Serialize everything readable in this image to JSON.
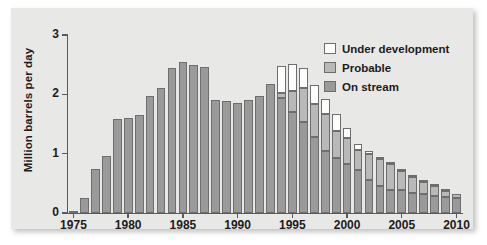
{
  "chart_data": {
    "type": "bar",
    "stacked": true,
    "title": "",
    "subtitle": "",
    "xlabel": "",
    "ylabel": "Million barrels per day",
    "ylim": [
      0,
      3
    ],
    "yticks": [
      0,
      1,
      2,
      3
    ],
    "ytick_labels": [
      "0",
      "1",
      "2",
      "3"
    ],
    "xlim": [
      1975,
      2010
    ],
    "xticks": [
      1975,
      1980,
      1985,
      1990,
      1995,
      2000,
      2005,
      2010
    ],
    "xtick_labels": [
      "1975",
      "1980",
      "1985",
      "1990",
      "1995",
      "2000",
      "2005",
      "2010"
    ],
    "grid": false,
    "legend_position": "top-right",
    "categories": [
      1975,
      1976,
      1977,
      1978,
      1979,
      1980,
      1981,
      1982,
      1983,
      1984,
      1985,
      1986,
      1987,
      1988,
      1989,
      1990,
      1991,
      1992,
      1993,
      1994,
      1995,
      1996,
      1997,
      1998,
      1999,
      2000,
      2001,
      2002,
      2003,
      2004,
      2005,
      2006,
      2007,
      2008,
      2009,
      2010
    ],
    "series": [
      {
        "name": "On stream",
        "color": "#9a9a9a",
        "values": [
          0.02,
          0.25,
          0.75,
          0.96,
          1.58,
          1.6,
          1.65,
          1.97,
          2.1,
          2.45,
          2.54,
          2.5,
          2.46,
          1.91,
          1.89,
          1.86,
          1.9,
          1.98,
          2.18,
          1.94,
          1.71,
          1.53,
          1.28,
          1.05,
          0.93,
          0.82,
          0.72,
          0.56,
          0.46,
          0.38,
          0.38,
          0.33,
          0.32,
          0.29,
          0.27,
          0.25
        ]
      },
      {
        "name": "Probable",
        "color": "#b9b9b9",
        "values": [
          0.0,
          0.0,
          0.0,
          0.0,
          0.0,
          0.0,
          0.0,
          0.0,
          0.0,
          0.0,
          0.0,
          0.0,
          0.0,
          0.0,
          0.0,
          0.0,
          0.0,
          0.0,
          0.0,
          0.08,
          0.34,
          0.57,
          0.55,
          0.62,
          0.46,
          0.45,
          0.35,
          0.44,
          0.45,
          0.44,
          0.32,
          0.27,
          0.2,
          0.16,
          0.1,
          0.07
        ]
      },
      {
        "name": "Under development",
        "color": "#fdfdfd",
        "values": [
          0.0,
          0.0,
          0.0,
          0.0,
          0.0,
          0.0,
          0.0,
          0.0,
          0.0,
          0.0,
          0.0,
          0.0,
          0.0,
          0.0,
          0.0,
          0.0,
          0.0,
          0.0,
          0.0,
          0.45,
          0.47,
          0.35,
          0.32,
          0.25,
          0.28,
          0.17,
          0.09,
          0.05,
          0.03,
          0.03,
          0.02,
          0.02,
          0.02,
          0.01,
          0.01,
          0.0
        ]
      }
    ],
    "totals": [
      0.02,
      0.25,
      0.75,
      0.96,
      1.58,
      1.6,
      1.65,
      1.97,
      2.1,
      2.45,
      2.54,
      2.5,
      2.46,
      1.91,
      1.89,
      1.86,
      1.9,
      1.98,
      2.18,
      2.47,
      2.52,
      2.45,
      2.15,
      1.92,
      1.67,
      1.44,
      1.16,
      1.05,
      0.94,
      0.85,
      0.72,
      0.62,
      0.54,
      0.46,
      0.38,
      0.32
    ],
    "legend": [
      {
        "label": "Under development",
        "color": "#fdfdfd"
      },
      {
        "label": "Probable",
        "color": "#b9b9b9"
      },
      {
        "label": "On stream",
        "color": "#9a9a9a"
      }
    ]
  }
}
